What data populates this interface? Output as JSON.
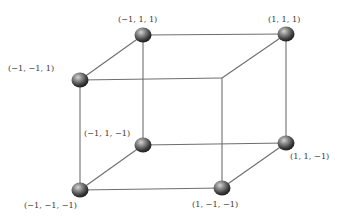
{
  "diagram": {
    "colors": {
      "edge": "#6e6e6e",
      "ball_light": "#bcbcbc",
      "ball_mid": "#6a6a6a",
      "ball_dark": "#2a2a2a",
      "label": "#3a3a3a"
    },
    "vertices": [
      {
        "id": "v_m1_m1_1",
        "label": "(−1, −1, 1)",
        "x": 80,
        "y": 80,
        "ball": true,
        "lx": 8,
        "ly": 71
      },
      {
        "id": "v_m1_1_1",
        "label": "(−1, 1, 1)",
        "x": 143,
        "y": 35,
        "ball": true,
        "lx": 118,
        "ly": 22
      },
      {
        "id": "v_1_1_1",
        "label": "(1, 1, 1)",
        "x": 286,
        "y": 34,
        "ball": true,
        "lx": 268,
        "ly": 22
      },
      {
        "id": "v_1_m1_1",
        "label": "",
        "x": 222,
        "y": 78,
        "ball": false,
        "lx": 0,
        "ly": 0
      },
      {
        "id": "v_m1_1_m1",
        "label": "(−1, 1, −1)",
        "x": 143,
        "y": 145,
        "ball": true,
        "lx": 84,
        "ly": 136
      },
      {
        "id": "v_m1_m1_m1",
        "label": "(−1, −1, −1)",
        "x": 80,
        "y": 190,
        "ball": true,
        "lx": 24,
        "ly": 208
      },
      {
        "id": "v_1_m1_m1",
        "label": "(1, −1, −1)",
        "x": 222,
        "y": 188,
        "ball": true,
        "lx": 192,
        "ly": 207
      },
      {
        "id": "v_1_1_m1",
        "label": "(1, 1, −1)",
        "x": 286,
        "y": 143,
        "ball": true,
        "lx": 290,
        "ly": 159
      }
    ],
    "edges": [
      [
        "v_m1_m1_1",
        "v_m1_1_1"
      ],
      [
        "v_m1_1_1",
        "v_1_1_1"
      ],
      [
        "v_m1_m1_1",
        "v_1_m1_1"
      ],
      [
        "v_1_m1_1",
        "v_1_1_1"
      ],
      [
        "v_m1_m1_m1",
        "v_m1_1_m1"
      ],
      [
        "v_m1_1_m1",
        "v_1_1_m1"
      ],
      [
        "v_m1_m1_m1",
        "v_1_m1_m1"
      ],
      [
        "v_1_m1_m1",
        "v_1_1_m1"
      ],
      [
        "v_m1_m1_1",
        "v_m1_m1_m1"
      ],
      [
        "v_m1_1_1",
        "v_m1_1_m1"
      ],
      [
        "v_1_1_1",
        "v_1_1_m1"
      ],
      [
        "v_1_m1_1",
        "v_1_m1_m1"
      ]
    ]
  }
}
